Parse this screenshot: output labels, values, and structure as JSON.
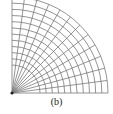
{
  "figure": {
    "caption": "(b)",
    "line_color": "#7a7a7a",
    "origin_color": "#222222"
  },
  "mesh": {
    "origin": [
      12,
      93
    ],
    "inner_radius": 28,
    "outer_radius": 96,
    "arc_count": 12,
    "spoke_count": 13,
    "angle_range_deg": [
      0,
      90
    ]
  }
}
